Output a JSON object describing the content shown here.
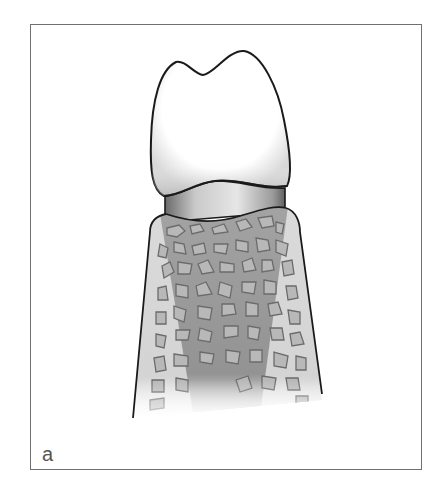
{
  "figure": {
    "panel_label": "a",
    "parts": [
      "crown",
      "cervical-neck",
      "alveolar-crest",
      "cancellous-bone",
      "root-region"
    ],
    "colors": {
      "frame_border": "#707070",
      "outline": "#1a1a1a",
      "crown_fill": "#ffffff",
      "neck_fill": "#cfcfcf",
      "bone_fill": "#dadada",
      "root_fill": "#9c9c9c",
      "trabecula_fill": "#b8b8b8",
      "trabecula_outline": "#6b6b6b",
      "label_color": "#555555"
    }
  }
}
